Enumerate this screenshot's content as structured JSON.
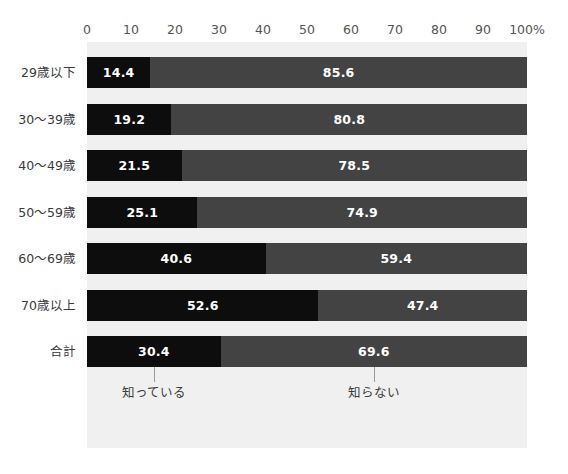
{
  "chart_data": {
    "type": "bar",
    "subtype": "stacked-horizontal-100",
    "title": "",
    "subtitle": "",
    "xlabel": "",
    "ylabel": "",
    "xlim": [
      0,
      100
    ],
    "grid": false,
    "legend_position": "below-total-bar",
    "axis_unit": "%",
    "categories": [
      "29歳以下",
      "30〜39歳",
      "40〜49歳",
      "50〜59歳",
      "60〜69歳",
      "70歳以上",
      "合計"
    ],
    "series": [
      {
        "name": "知っている",
        "color": "#0d0d0d",
        "values": [
          14.4,
          19.2,
          21.5,
          25.1,
          40.6,
          52.6,
          30.4
        ]
      },
      {
        "name": "知らない",
        "color": "#434343",
        "values": [
          85.6,
          80.8,
          78.5,
          74.9,
          59.4,
          47.4,
          69.6
        ]
      }
    ],
    "tick_values": [
      0,
      10,
      20,
      30,
      40,
      50,
      60,
      70,
      80,
      90,
      100
    ],
    "tick_labels": [
      "0",
      "10",
      "20",
      "30",
      "40",
      "50",
      "60",
      "70",
      "80",
      "90",
      "100%"
    ]
  },
  "rows": [
    {
      "label": "29歳以下",
      "know_value": 14.4,
      "know_label": "14.4",
      "dontknow_value": 85.6,
      "dontknow_label": "85.6"
    },
    {
      "label": "30〜39歳",
      "know_value": 19.2,
      "know_label": "19.2",
      "dontknow_value": 80.8,
      "dontknow_label": "80.8"
    },
    {
      "label": "40〜49歳",
      "know_value": 21.5,
      "know_label": "21.5",
      "dontknow_value": 78.5,
      "dontknow_label": "78.5"
    },
    {
      "label": "50〜59歳",
      "know_value": 25.1,
      "know_label": "25.1",
      "dontknow_value": 74.9,
      "dontknow_label": "74.9"
    },
    {
      "label": "60〜69歳",
      "know_value": 40.6,
      "know_label": "40.6",
      "dontknow_value": 59.4,
      "dontknow_label": "59.4"
    },
    {
      "label": "70歳以上",
      "know_value": 52.6,
      "know_label": "52.6",
      "dontknow_value": 47.4,
      "dontknow_label": "47.4"
    },
    {
      "label": "合計",
      "know_value": 30.4,
      "know_label": "30.4",
      "dontknow_value": 69.6,
      "dontknow_label": "69.6"
    }
  ],
  "legend": {
    "know_label": "知っている",
    "dontknow_label": "知らない"
  },
  "colors": {
    "panel_background": "#f0f0f0",
    "page_background": "#ffffff",
    "know_bar": "#0d0d0d",
    "dontknow_bar": "#434343",
    "tick_text": "#555555",
    "label_text": "#3a3a3a",
    "leader_line": "#9a9a9a"
  }
}
